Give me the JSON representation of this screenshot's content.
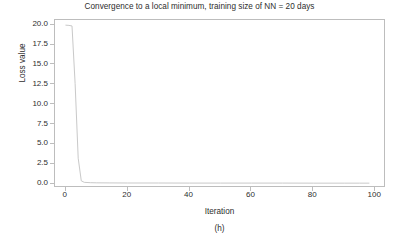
{
  "figure": {
    "width": 399,
    "height": 243,
    "background_color": "#ffffff",
    "sub_caption": "(h)"
  },
  "chart_data": {
    "type": "line",
    "title": "Convergence to a local minimum, training size of NN = 20 days",
    "xlabel": "Iteration",
    "ylabel": "Loss value",
    "xlim": [
      -3.5,
      103.5
    ],
    "ylim": [
      -0.55,
      20.6
    ],
    "xticks": [
      0,
      20,
      40,
      60,
      80,
      100
    ],
    "xticklabels": [
      "0",
      "20",
      "40",
      "60",
      "80",
      "100"
    ],
    "yticks": [
      0.0,
      2.5,
      5.0,
      7.5,
      10.0,
      12.5,
      15.0,
      17.5,
      20.0
    ],
    "yticklabels": [
      "0.0",
      "2.5",
      "5.0",
      "7.5",
      "10.0",
      "12.5",
      "15.0",
      "17.5",
      "20.0"
    ],
    "grid": false,
    "legend": false,
    "line_color": "#c9c9c9",
    "line_width": 1.0,
    "axis_color": "#bdbdbd",
    "text_color": "#2e2e2e",
    "series": [
      {
        "name": "Loss value",
        "x": [
          0,
          1,
          2,
          3,
          4,
          5,
          6,
          8,
          10,
          14,
          20,
          30,
          40,
          50,
          60,
          70,
          80,
          90,
          95,
          98
        ],
        "y": [
          19.95,
          19.92,
          19.85,
          12.6,
          3.2,
          0.35,
          0.16,
          0.12,
          0.1,
          0.09,
          0.08,
          0.08,
          0.07,
          0.07,
          0.07,
          0.07,
          0.06,
          0.06,
          0.06,
          0.06
        ]
      }
    ]
  }
}
